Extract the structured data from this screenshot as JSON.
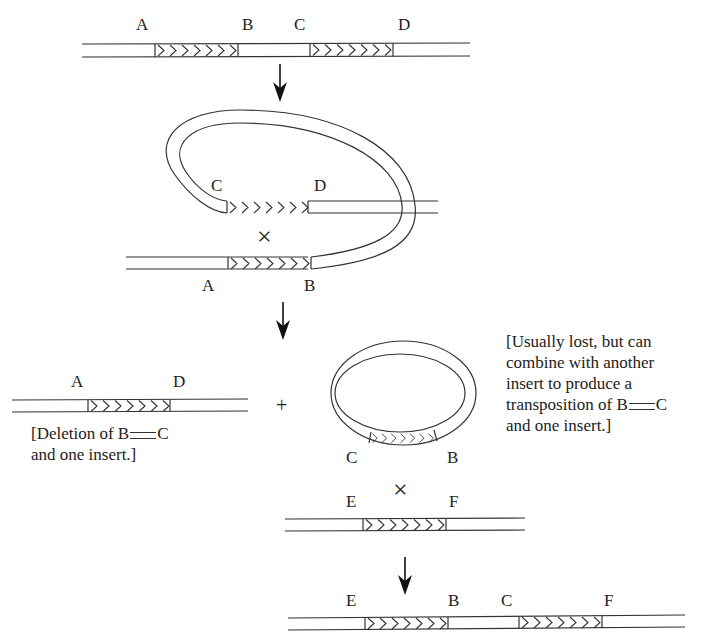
{
  "figure": {
    "step1": {
      "labels": [
        "A",
        "B",
        "C",
        "D"
      ]
    },
    "step2": {
      "labels_top": [
        "C",
        "D"
      ],
      "labels_bottom": [
        "A",
        "B"
      ],
      "crossover_symbol": "×"
    },
    "step3": {
      "left_labels": [
        "A",
        "D"
      ],
      "plus": "+",
      "circle_labels": [
        "C",
        "B"
      ],
      "deletion_note": {
        "line1_prefix": "[Deletion of B",
        "line1_suffix": "C",
        "line2": "and one insert.]"
      },
      "circle_note": {
        "line1": "[Usually lost, but can",
        "line2": "combine with another",
        "line3": "insert to produce a",
        "line4_prefix": "transposition of B",
        "line4_suffix": "C",
        "line5": "and one insert.]"
      },
      "target_labels": [
        "E",
        "F"
      ],
      "crossover_symbol": "×"
    },
    "step4": {
      "labels": [
        "E",
        "B",
        "C",
        "F"
      ]
    }
  }
}
